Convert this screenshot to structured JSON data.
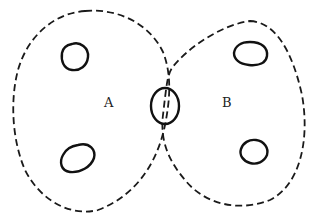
{
  "diagram": {
    "regions": [
      {
        "id": "A",
        "label": "A",
        "style": "dashed"
      },
      {
        "id": "B",
        "label": "B",
        "style": "dashed"
      }
    ],
    "loops": [
      {
        "region": "A",
        "position": "upper"
      },
      {
        "region": "A",
        "position": "lower"
      },
      {
        "region": "B",
        "position": "upper"
      },
      {
        "region": "B",
        "position": "lower"
      },
      {
        "region": "A∩B",
        "position": "boundary"
      }
    ],
    "colors": {
      "stroke": "#111111",
      "background": "#ffffff"
    }
  }
}
